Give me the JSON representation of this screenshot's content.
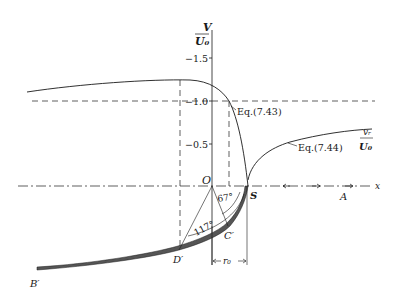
{
  "figure": {
    "y_axis_label": {
      "numerator": "V",
      "denominator": "U₀"
    },
    "y_ticks": [
      "−1.5",
      "−1.0",
      "−0.5"
    ],
    "x_axis_label": "x",
    "origin_label": "O",
    "points": {
      "S": "S",
      "A": "A",
      "B_prime": "B′",
      "C_prime": "C′",
      "D_prime": "D′"
    },
    "angles": {
      "angle_C": "67°",
      "angle_D": "117°"
    },
    "dimension_label": "r₀",
    "curve_labels": {
      "eq_743": "Eq.(7.43)",
      "eq_744": "Eq.(7.44)",
      "vr_numerator": "vᵣ",
      "vr_denominator": "U₀"
    },
    "colors": {
      "ink": "#1a1a1a",
      "body_shade": "#555555",
      "background": "#ffffff"
    }
  }
}
